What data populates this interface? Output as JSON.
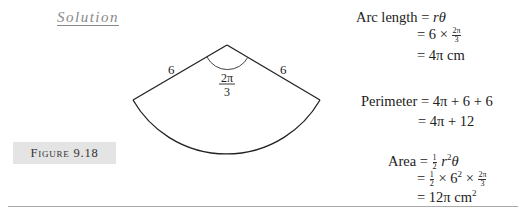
{
  "heading": {
    "solution_label": "Solution"
  },
  "figure": {
    "label": "Figure 9.18",
    "radius_left_label": "6",
    "radius_right_label": "6",
    "angle_numerator": "2π",
    "angle_denominator": "3"
  },
  "arc_length": {
    "lhs": "Arc length",
    "eq": "=",
    "line1_expr_r": "r",
    "line1_expr_theta": "θ",
    "line2_prefix": "= 6 ×",
    "line2_num": "2π",
    "line2_den": "3",
    "line3": "= 4π cm"
  },
  "perimeter": {
    "lhs": "Perimeter",
    "line1": "= 4π + 6 + 6",
    "line2": "= 4π + 12"
  },
  "area": {
    "lhs": "Area",
    "eq": "=",
    "half_num": "1",
    "half_den": "2",
    "line1_r": "r",
    "line1_sup": "2",
    "line1_theta": "θ",
    "line2_eq": "=",
    "line2_mid": "× 6",
    "line2_sup": "2",
    "line2_times": "×",
    "line2_num": "2π",
    "line2_den": "3",
    "line3": "= 12π cm",
    "line3_sup": "2"
  }
}
